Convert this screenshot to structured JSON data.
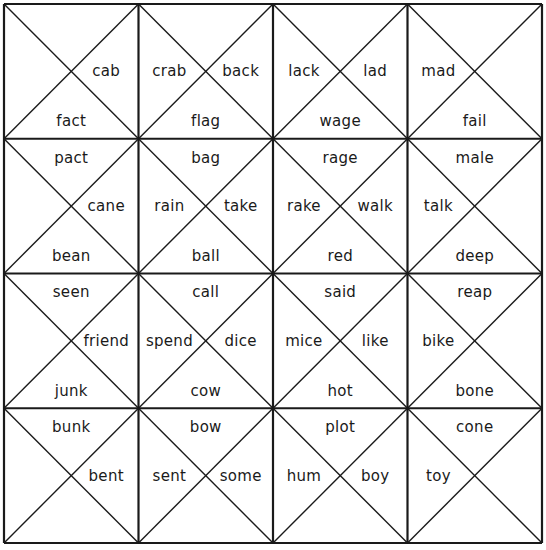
{
  "puzzle": {
    "rows": 4,
    "cols": 4,
    "line_color": "#1a1a1a",
    "text_color": "#1a1a1a",
    "cells": [
      [
        {
          "top": "",
          "right": "cab",
          "bottom": "fact",
          "left": ""
        },
        {
          "top": "",
          "right": "back",
          "bottom": "flag",
          "left": "crab"
        },
        {
          "top": "",
          "right": "lad",
          "bottom": "wage",
          "left": "lack"
        },
        {
          "top": "",
          "right": "",
          "bottom": "fail",
          "left": "mad"
        }
      ],
      [
        {
          "top": "pact",
          "right": "cane",
          "bottom": "bean",
          "left": ""
        },
        {
          "top": "bag",
          "right": "take",
          "bottom": "ball",
          "left": "rain"
        },
        {
          "top": "rage",
          "right": "walk",
          "bottom": "red",
          "left": "rake"
        },
        {
          "top": "male",
          "right": "",
          "bottom": "deep",
          "left": "talk"
        }
      ],
      [
        {
          "top": "seen",
          "right": "friend",
          "bottom": "junk",
          "left": ""
        },
        {
          "top": "call",
          "right": "dice",
          "bottom": "cow",
          "left": "spend"
        },
        {
          "top": "said",
          "right": "like",
          "bottom": "hot",
          "left": "mice"
        },
        {
          "top": "reap",
          "right": "",
          "bottom": "bone",
          "left": "bike"
        }
      ],
      [
        {
          "top": "bunk",
          "right": "bent",
          "bottom": "",
          "left": ""
        },
        {
          "top": "bow",
          "right": "some",
          "bottom": "",
          "left": "sent"
        },
        {
          "top": "plot",
          "right": "boy",
          "bottom": "",
          "left": "hum"
        },
        {
          "top": "cone",
          "right": "",
          "bottom": "",
          "left": "toy"
        }
      ]
    ]
  }
}
